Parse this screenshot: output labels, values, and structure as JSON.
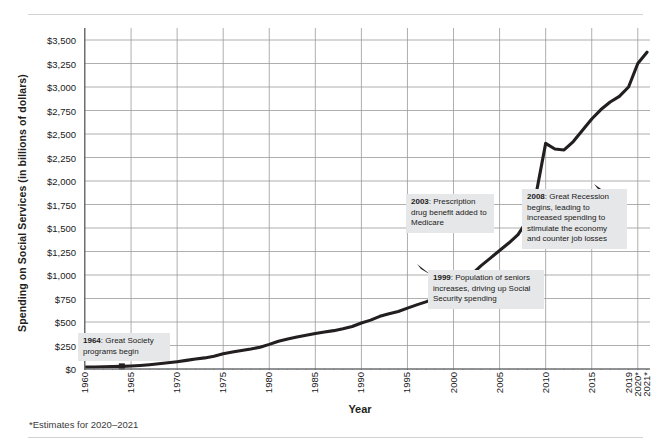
{
  "chart_data": {
    "type": "line",
    "title": "",
    "xlabel": "Year",
    "ylabel": "Spending on Social Services (in billions of dollars)",
    "ylim": [
      0,
      3500
    ],
    "xlim": [
      1960,
      2021
    ],
    "grid": true,
    "legend": false,
    "footnote": "*Estimates for 2020–2021",
    "ytick_labels": [
      "$3,500",
      "$3,250",
      "$3,000",
      "$2,750",
      "$2,500",
      "$2,250",
      "$2,000",
      "$1,750",
      "$1,500",
      "$1,250",
      "$1,000",
      "$750",
      "$500",
      "$250",
      "$0"
    ],
    "ytick_values": [
      3500,
      3250,
      3000,
      2750,
      2500,
      2250,
      2000,
      1750,
      1500,
      1250,
      1000,
      750,
      500,
      250,
      0
    ],
    "xtick_labels": [
      "1960",
      "1965",
      "1970",
      "1975",
      "1980",
      "1985",
      "1990",
      "1995",
      "2000",
      "2005",
      "2010",
      "2015",
      "2019",
      "2020*",
      "2021*"
    ],
    "xtick_values": [
      1960,
      1965,
      1970,
      1975,
      1980,
      1985,
      1990,
      1995,
      2000,
      2005,
      2010,
      2015,
      2019,
      2020,
      2021
    ],
    "x": [
      1960,
      1961,
      1962,
      1963,
      1964,
      1965,
      1966,
      1967,
      1968,
      1969,
      1970,
      1971,
      1972,
      1973,
      1974,
      1975,
      1976,
      1977,
      1978,
      1979,
      1980,
      1981,
      1982,
      1983,
      1984,
      1985,
      1986,
      1987,
      1988,
      1989,
      1990,
      1991,
      1992,
      1993,
      1994,
      1995,
      1996,
      1997,
      1998,
      1999,
      2000,
      2001,
      2002,
      2003,
      2004,
      2005,
      2006,
      2007,
      2008,
      2009,
      2010,
      2011,
      2012,
      2013,
      2014,
      2015,
      2016,
      2017,
      2018,
      2019,
      2020,
      2021
    ],
    "values": [
      20,
      22,
      24,
      26,
      28,
      32,
      38,
      46,
      56,
      66,
      78,
      92,
      106,
      118,
      136,
      162,
      180,
      196,
      212,
      232,
      262,
      296,
      320,
      340,
      358,
      378,
      394,
      408,
      428,
      452,
      490,
      520,
      560,
      588,
      612,
      648,
      682,
      714,
      752,
      800,
      860,
      930,
      1010,
      1100,
      1180,
      1260,
      1340,
      1430,
      1580,
      1880,
      2400,
      2340,
      2330,
      2420,
      2540,
      2660,
      2760,
      2840,
      2900,
      3000,
      3250,
      3370
    ],
    "markers": [
      {
        "year": 1964,
        "value": 28
      },
      {
        "year": 1999,
        "value": 800
      },
      {
        "year": 2008,
        "value": 1580
      }
    ],
    "annotations": [
      {
        "year": "1964",
        "text": "Great Society programs begin"
      },
      {
        "year": "2003",
        "text": "Prescription drug benefit added to Medicare"
      },
      {
        "year": "1999",
        "text": "Population of seniors increases, driving up Social Security spending"
      },
      {
        "year": "2008",
        "text": "Great Recession begins, leading to increased spending to stimulate the economy and counter job losses"
      }
    ],
    "colors": {
      "line": "#231f20",
      "grid": "#9b9b9b",
      "axis": "#6d6e71",
      "callout_bg": "#e6e7e8",
      "text": "#231f20",
      "rule": "#d2d2d2"
    }
  }
}
